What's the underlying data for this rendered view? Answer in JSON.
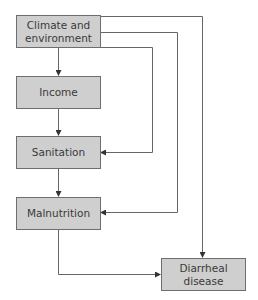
{
  "diagram": {
    "type": "flowchart",
    "nodes": [
      {
        "id": "climate",
        "label": "Climate and\nenvironment"
      },
      {
        "id": "income",
        "label": "Income"
      },
      {
        "id": "sanitation",
        "label": "Sanitation"
      },
      {
        "id": "malnutrition",
        "label": "Malnutrition"
      },
      {
        "id": "diarrheal",
        "label": "Diarrheal\ndisease"
      }
    ],
    "edges": [
      {
        "from": "climate",
        "to": "income"
      },
      {
        "from": "income",
        "to": "sanitation"
      },
      {
        "from": "sanitation",
        "to": "malnutrition"
      },
      {
        "from": "climate",
        "to": "sanitation"
      },
      {
        "from": "climate",
        "to": "malnutrition"
      },
      {
        "from": "climate",
        "to": "diarrheal"
      },
      {
        "from": "malnutrition",
        "to": "diarrheal"
      }
    ],
    "colors": {
      "box_fill": "#cfcfcf",
      "box_border": "#6e6e6e",
      "line": "#555555"
    }
  }
}
